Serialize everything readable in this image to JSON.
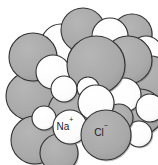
{
  "figure": {
    "name": "sodium-chloride-crystal-lattice",
    "background_color": "#ffffff",
    "width": 158,
    "height": 165
  },
  "legend": {
    "sodium": {
      "symbol": "Na",
      "charge": "+",
      "full_label": "Na⁺",
      "fill_color": "#ffffff",
      "stroke_color": "#333333",
      "label_x": 65,
      "label_y": 127
    },
    "chloride": {
      "symbol": "Cl",
      "charge": "−",
      "full_label": "Cl⁻",
      "fill_color": "#a9a9a9",
      "stroke_color": "#333333",
      "label_x": 101,
      "label_y": 133
    }
  },
  "style": {
    "sodium_fill": "#ffffff",
    "chloride_fill": "#a9a9a9",
    "outline": "#333333",
    "outline_width": 1.1,
    "shadow": "#707070"
  },
  "spheres": [
    {
      "id": "s01",
      "ion": "chloride",
      "cx": 30,
      "cy": 96,
      "r": 24,
      "z": 1
    },
    {
      "id": "s02",
      "ion": "chloride",
      "cx": 72,
      "cy": 112,
      "r": 24,
      "z": 2
    },
    {
      "id": "s03",
      "ion": "chloride",
      "cx": 35,
      "cy": 140,
      "r": 24,
      "z": 3
    },
    {
      "id": "s04",
      "ion": "sodium",
      "cx": 53,
      "cy": 72,
      "r": 17,
      "z": 4
    },
    {
      "id": "s05",
      "ion": "sodium",
      "cx": 70,
      "cy": 127,
      "r": 17,
      "z": 12
    },
    {
      "id": "s06",
      "ion": "chloride",
      "cx": 106,
      "cy": 135,
      "r": 25,
      "z": 13
    },
    {
      "id": "s07",
      "ion": "chloride",
      "cx": 140,
      "cy": 112,
      "r": 23,
      "z": 6
    },
    {
      "id": "s08",
      "ion": "sodium",
      "cx": 124,
      "cy": 95,
      "r": 17,
      "z": 7
    },
    {
      "id": "s09",
      "ion": "chloride",
      "cx": 150,
      "cy": 78,
      "r": 22,
      "z": 5
    },
    {
      "id": "s10",
      "ion": "sodium",
      "cx": 146,
      "cy": 52,
      "r": 16,
      "z": 4
    },
    {
      "id": "s11",
      "ion": "chloride",
      "cx": 128,
      "cy": 60,
      "r": 24,
      "z": 5
    },
    {
      "id": "s12",
      "ion": "chloride",
      "cx": 96,
      "cy": 65,
      "r": 29,
      "z": 8
    },
    {
      "id": "s13",
      "ion": "sodium",
      "cx": 96,
      "cy": 103,
      "r": 18,
      "z": 11
    },
    {
      "id": "s14",
      "ion": "sodium",
      "cx": 64,
      "cy": 89,
      "r": 13,
      "z": 9
    },
    {
      "id": "s15",
      "ion": "chloride",
      "cx": 33,
      "cy": 57,
      "r": 24,
      "z": 3
    },
    {
      "id": "s16",
      "ion": "sodium",
      "cx": 61,
      "cy": 44,
      "r": 20,
      "z": 2
    },
    {
      "id": "s17",
      "ion": "chloride",
      "cx": 83,
      "cy": 30,
      "r": 22,
      "z": 2
    },
    {
      "id": "s18",
      "ion": "sodium",
      "cx": 110,
      "cy": 36,
      "r": 18,
      "z": 2
    },
    {
      "id": "s19",
      "ion": "chloride",
      "cx": 132,
      "cy": 34,
      "r": 20,
      "z": 1
    },
    {
      "id": "s20",
      "ion": "sodium",
      "cx": 150,
      "cy": 108,
      "r": 14,
      "z": 7
    },
    {
      "id": "s21",
      "ion": "sodium",
      "cx": 44,
      "cy": 118,
      "r": 12,
      "z": 5
    },
    {
      "id": "s22",
      "ion": "chloride",
      "cx": 119,
      "cy": 118,
      "r": 14,
      "z": 10
    },
    {
      "id": "s23",
      "ion": "sodium",
      "cx": 88,
      "cy": 88,
      "r": 11,
      "z": 10
    },
    {
      "id": "s24",
      "ion": "chloride",
      "cx": 59,
      "cy": 153,
      "r": 19,
      "z": 11
    },
    {
      "id": "s25",
      "ion": "sodium",
      "cx": 139,
      "cy": 134,
      "r": 13,
      "z": 9
    }
  ]
}
